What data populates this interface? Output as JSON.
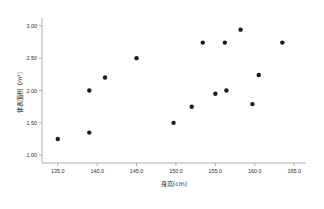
{
  "chart_data": {
    "type": "scatter",
    "title": "",
    "xlabel": "身高(cm)",
    "ylabel": "体表面积（m²）",
    "xlim": [
      133.0,
      166.5
    ],
    "ylim": [
      0.88,
      3.12
    ],
    "xticks": [
      "135.0",
      "140.0",
      "145.0",
      "150.0",
      "155.0",
      "160.0",
      "165.0"
    ],
    "xtick_values": [
      135.0,
      140.0,
      145.0,
      150.0,
      155.0,
      160.0,
      165.0
    ],
    "yticks": [
      "1.00",
      "1.50",
      "2.00",
      "2.50",
      "3.00"
    ],
    "ytick_values": [
      1.0,
      1.5,
      2.0,
      2.5,
      3.0
    ],
    "grid": false,
    "legend": null,
    "marker": "filled-circle",
    "marker_color": "#1a1a1a",
    "points": [
      {
        "x": 135.0,
        "y": 1.25
      },
      {
        "x": 139.0,
        "y": 2.0
      },
      {
        "x": 139.0,
        "y": 1.35
      },
      {
        "x": 141.0,
        "y": 2.2
      },
      {
        "x": 145.0,
        "y": 2.5
      },
      {
        "x": 149.7,
        "y": 1.5
      },
      {
        "x": 152.0,
        "y": 1.75
      },
      {
        "x": 153.4,
        "y": 2.74
      },
      {
        "x": 155.0,
        "y": 1.95
      },
      {
        "x": 156.2,
        "y": 2.74
      },
      {
        "x": 156.4,
        "y": 2.0
      },
      {
        "x": 158.2,
        "y": 2.94
      },
      {
        "x": 159.7,
        "y": 1.79
      },
      {
        "x": 160.5,
        "y": 2.24
      },
      {
        "x": 163.5,
        "y": 2.74
      }
    ]
  }
}
